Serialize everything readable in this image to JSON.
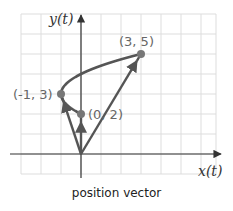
{
  "diagram": {
    "caption": "position vector",
    "axes": {
      "x_label": "x(t)",
      "y_label": "y(t)"
    },
    "grid": {
      "x_min": -3,
      "x_max": 6.75,
      "y_min": -1,
      "y_max": 7,
      "step": 1
    },
    "points": [
      {
        "x": 3,
        "y": 5,
        "label": "(3, 5)"
      },
      {
        "x": -1,
        "y": 3,
        "label": "(-1, 3)"
      },
      {
        "x": 0,
        "y": 2,
        "label": "(0, 2)"
      }
    ],
    "vectors": [
      {
        "from": [
          0,
          0
        ],
        "to": [
          3,
          5
        ]
      },
      {
        "from": [
          0,
          0
        ],
        "to": [
          -1,
          3
        ]
      },
      {
        "from": [
          0,
          0
        ],
        "to": [
          0,
          2
        ]
      }
    ],
    "curve": {
      "equation": "x = (y - 3)^2 - 1",
      "y_range": [
        2,
        5
      ]
    },
    "colors": {
      "grid": "#dddddd",
      "axes": "#333333",
      "vectors": "#555555",
      "curve": "#555555",
      "points": "#777777",
      "labels": "#666666"
    }
  }
}
